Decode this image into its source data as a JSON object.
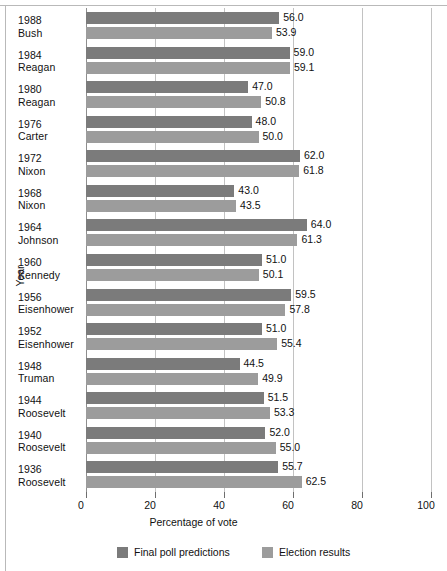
{
  "chart_data": {
    "type": "bar",
    "orientation": "horizontal",
    "title": "",
    "xlabel": "Percentage of vote",
    "ylabel": "Year",
    "xlim": [
      0,
      100
    ],
    "xticks": [
      0,
      20,
      40,
      60,
      80,
      100
    ],
    "xtick_labels": [
      "0",
      "20",
      "40",
      "60",
      "80",
      "100"
    ],
    "grid": true,
    "grid_axis": "x",
    "legend_position": "bottom",
    "categories": [
      "1988 Bush",
      "1984 Reagan",
      "1980 Reagan",
      "1976 Carter",
      "1972 Nixon",
      "1968 Nixon",
      "1964 Johnson",
      "1960 Kennedy",
      "1956 Eisenhower",
      "1952 Eisenhower",
      "1948 Truman",
      "1944 Roosevelt",
      "1940 Roosevelt",
      "1936 Roosevelt"
    ],
    "series": [
      {
        "name": "Final poll predictions",
        "color": "#7b7b7b",
        "values": [
          56.0,
          59.0,
          47.0,
          48.0,
          62.0,
          43.0,
          64.0,
          51.0,
          59.5,
          51.0,
          44.5,
          51.5,
          52.0,
          55.7
        ]
      },
      {
        "name": "Election results",
        "color": "#9c9c9c",
        "values": [
          53.9,
          59.1,
          50.8,
          50.0,
          61.8,
          43.5,
          61.3,
          50.1,
          57.8,
          55.4,
          49.9,
          53.3,
          55.0,
          62.5
        ]
      }
    ]
  },
  "rows": [
    {
      "year": "1988",
      "name": "Bush",
      "pred": "56.0",
      "res": "53.9",
      "pred_v": 56.0,
      "res_v": 53.9
    },
    {
      "year": "1984",
      "name": "Reagan",
      "pred": "59.0",
      "res": "59.1",
      "pred_v": 59.0,
      "res_v": 59.1
    },
    {
      "year": "1980",
      "name": "Reagan",
      "pred": "47.0",
      "res": "50.8",
      "pred_v": 47.0,
      "res_v": 50.8
    },
    {
      "year": "1976",
      "name": "Carter",
      "pred": "48.0",
      "res": "50.0",
      "pred_v": 48.0,
      "res_v": 50.0
    },
    {
      "year": "1972",
      "name": "Nixon",
      "pred": "62.0",
      "res": "61.8",
      "pred_v": 62.0,
      "res_v": 61.8
    },
    {
      "year": "1968",
      "name": "Nixon",
      "pred": "43.0",
      "res": "43.5",
      "pred_v": 43.0,
      "res_v": 43.5
    },
    {
      "year": "1964",
      "name": "Johnson",
      "pred": "64.0",
      "res": "61.3",
      "pred_v": 64.0,
      "res_v": 61.3
    },
    {
      "year": "1960",
      "name": "Kennedy",
      "pred": "51.0",
      "res": "50.1",
      "pred_v": 51.0,
      "res_v": 50.1
    },
    {
      "year": "1956",
      "name": "Eisenhower",
      "pred": "59.5",
      "res": "57.8",
      "pred_v": 59.5,
      "res_v": 57.8
    },
    {
      "year": "1952",
      "name": "Eisenhower",
      "pred": "51.0",
      "res": "55.4",
      "pred_v": 51.0,
      "res_v": 55.4
    },
    {
      "year": "1948",
      "name": "Truman",
      "pred": "44.5",
      "res": "49.9",
      "pred_v": 44.5,
      "res_v": 49.9
    },
    {
      "year": "1944",
      "name": "Roosevelt",
      "pred": "51.5",
      "res": "53.3",
      "pred_v": 51.5,
      "res_v": 53.3
    },
    {
      "year": "1940",
      "name": "Roosevelt",
      "pred": "52.0",
      "res": "55.0",
      "pred_v": 52.0,
      "res_v": 55.0
    },
    {
      "year": "1936",
      "name": "Roosevelt",
      "pred": "55.7",
      "res": "62.5",
      "pred_v": 55.7,
      "res_v": 62.5
    }
  ],
  "axes": {
    "y_title": "Year",
    "x_title": "Percentage of vote",
    "x_ticks": [
      "0",
      "20",
      "40",
      "60",
      "80",
      "100"
    ]
  },
  "legend": {
    "items": [
      {
        "label": "Final poll predictions",
        "color": "#7b7b7b"
      },
      {
        "label": "Election results",
        "color": "#9c9c9c"
      }
    ]
  },
  "colors": {
    "prediction_bar": "#7b7b7b",
    "result_bar": "#9c9c9c",
    "gridline": "#c2c2c2",
    "axis": "#8e8e8e",
    "text": "#111111",
    "background": "#ffffff"
  }
}
